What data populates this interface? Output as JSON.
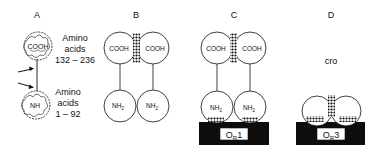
{
  "panels": {
    "a": {
      "label": "A",
      "upper_domain": {
        "text": "COOH",
        "caption_line1": "Amino",
        "caption_line2": "acids",
        "caption_line3": "132 – 236"
      },
      "lower_domain": {
        "text": "NH",
        "caption_line1": "Amino",
        "caption_line2": "acids",
        "caption_line3": "1 – 92"
      }
    },
    "b": {
      "label": "B",
      "left_top": "COOH",
      "right_top": "COOH",
      "left_bottom": "NH",
      "right_bottom": "NH",
      "sub": "2"
    },
    "c": {
      "label": "C",
      "left_top": "COOH",
      "right_top": "COOH",
      "left_bottom": "NH",
      "right_bottom": "NH",
      "sub": "2",
      "operator": "O",
      "operator_sub": "R",
      "operator_num": "1"
    },
    "d": {
      "label": "D",
      "protein": "cro",
      "operator": "O",
      "operator_sub": "R",
      "operator_num": "3"
    }
  },
  "colors": {
    "ink": "#111111",
    "fill": "#ffffff",
    "dna": "#0d0d0d"
  }
}
